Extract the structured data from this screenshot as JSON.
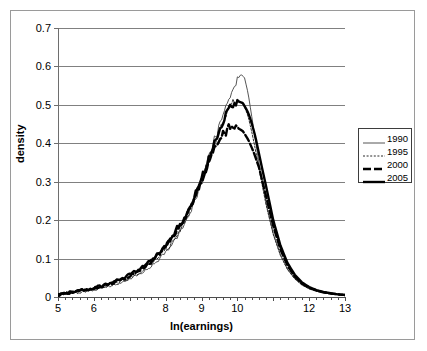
{
  "chart_data": {
    "type": "line",
    "title": "",
    "xlabel": "ln(earnings)",
    "ylabel": "density",
    "xlim": [
      5,
      13
    ],
    "ylim": [
      0,
      0.7
    ],
    "grid": true,
    "legend_position": "right",
    "y_ticks": [
      "0",
      "0.1",
      "0.2",
      "0.3",
      "0.4",
      "0.5",
      "0.6",
      "0.7"
    ],
    "y_tick_values": [
      0,
      0.1,
      0.2,
      0.3,
      0.4,
      0.5,
      0.6,
      0.7
    ],
    "x_ticks": [
      "5",
      "6",
      "",
      "8",
      "9",
      "10",
      "",
      "12",
      "13"
    ],
    "x_tick_values": [
      5,
      6,
      7,
      8,
      9,
      10,
      11,
      12,
      13
    ],
    "x_minor_tick_step": 0.2,
    "series": [
      {
        "name": "1990",
        "style": "thin-solid",
        "color": "#555555",
        "width": 1,
        "x": [
          5.0,
          5.2,
          5.4,
          5.6,
          5.8,
          6.0,
          6.2,
          6.4,
          6.6,
          6.8,
          7.0,
          7.2,
          7.4,
          7.6,
          7.8,
          8.0,
          8.2,
          8.4,
          8.6,
          8.8,
          9.0,
          9.2,
          9.4,
          9.6,
          9.8,
          10.0,
          10.1,
          10.2,
          10.3,
          10.4,
          10.5,
          10.6,
          10.8,
          11.0,
          11.2,
          11.4,
          11.6,
          11.8,
          12.0,
          12.2,
          12.4,
          12.6,
          12.8,
          13.0
        ],
        "y": [
          0.006,
          0.009,
          0.012,
          0.014,
          0.017,
          0.02,
          0.024,
          0.028,
          0.033,
          0.039,
          0.046,
          0.055,
          0.066,
          0.08,
          0.096,
          0.116,
          0.14,
          0.17,
          0.205,
          0.248,
          0.3,
          0.36,
          0.42,
          0.48,
          0.53,
          0.565,
          0.58,
          0.57,
          0.53,
          0.47,
          0.41,
          0.35,
          0.245,
          0.165,
          0.11,
          0.072,
          0.048,
          0.032,
          0.022,
          0.016,
          0.012,
          0.009,
          0.007,
          0.005
        ]
      },
      {
        "name": "1995",
        "style": "dotted",
        "color": "#2b2b2b",
        "width": 1,
        "x": [
          5.0,
          5.2,
          5.4,
          5.6,
          5.8,
          6.0,
          6.2,
          6.4,
          6.6,
          6.8,
          7.0,
          7.2,
          7.4,
          7.6,
          7.8,
          8.0,
          8.2,
          8.4,
          8.6,
          8.8,
          9.0,
          9.2,
          9.4,
          9.6,
          9.8,
          10.0,
          10.1,
          10.2,
          10.3,
          10.4,
          10.5,
          10.6,
          10.8,
          11.0,
          11.2,
          11.4,
          11.6,
          11.8,
          12.0,
          12.2,
          12.4,
          12.6,
          12.8,
          13.0
        ],
        "y": [
          0.005,
          0.008,
          0.011,
          0.013,
          0.016,
          0.02,
          0.024,
          0.029,
          0.035,
          0.042,
          0.05,
          0.06,
          0.072,
          0.086,
          0.102,
          0.122,
          0.146,
          0.175,
          0.21,
          0.252,
          0.3,
          0.355,
          0.41,
          0.462,
          0.498,
          0.512,
          0.508,
          0.495,
          0.47,
          0.43,
          0.385,
          0.335,
          0.24,
          0.163,
          0.108,
          0.071,
          0.047,
          0.031,
          0.021,
          0.015,
          0.011,
          0.008,
          0.006,
          0.005
        ]
      },
      {
        "name": "2000",
        "style": "thick-dashed",
        "color": "#000000",
        "width": 2.4,
        "x": [
          5.0,
          5.2,
          5.4,
          5.6,
          5.8,
          6.0,
          6.2,
          6.4,
          6.6,
          6.8,
          7.0,
          7.2,
          7.4,
          7.6,
          7.8,
          8.0,
          8.2,
          8.4,
          8.6,
          8.8,
          9.0,
          9.2,
          9.4,
          9.6,
          9.8,
          10.0,
          10.15,
          10.3,
          10.45,
          10.6,
          10.8,
          11.0,
          11.2,
          11.4,
          11.6,
          11.8,
          12.0,
          12.2,
          12.4,
          12.6,
          12.8,
          13.0
        ],
        "y": [
          0.006,
          0.01,
          0.013,
          0.016,
          0.019,
          0.023,
          0.028,
          0.034,
          0.04,
          0.047,
          0.056,
          0.066,
          0.078,
          0.092,
          0.11,
          0.13,
          0.155,
          0.184,
          0.218,
          0.258,
          0.302,
          0.348,
          0.392,
          0.424,
          0.438,
          0.44,
          0.432,
          0.41,
          0.378,
          0.338,
          0.262,
          0.185,
          0.124,
          0.081,
          0.053,
          0.035,
          0.024,
          0.017,
          0.012,
          0.009,
          0.007,
          0.005
        ]
      },
      {
        "name": "2005",
        "style": "thick-solid",
        "color": "#000000",
        "width": 2.4,
        "x": [
          5.0,
          5.2,
          5.4,
          5.6,
          5.8,
          6.0,
          6.2,
          6.4,
          6.6,
          6.8,
          7.0,
          7.2,
          7.4,
          7.6,
          7.8,
          8.0,
          8.2,
          8.4,
          8.6,
          8.8,
          9.0,
          9.2,
          9.4,
          9.6,
          9.8,
          10.0,
          10.15,
          10.3,
          10.4,
          10.5,
          10.65,
          10.8,
          11.0,
          11.2,
          11.4,
          11.6,
          11.8,
          12.0,
          12.2,
          12.4,
          12.6,
          12.8,
          13.0
        ],
        "y": [
          0.007,
          0.011,
          0.014,
          0.017,
          0.02,
          0.024,
          0.029,
          0.034,
          0.04,
          0.048,
          0.057,
          0.068,
          0.08,
          0.095,
          0.113,
          0.134,
          0.159,
          0.188,
          0.222,
          0.262,
          0.308,
          0.36,
          0.412,
          0.462,
          0.498,
          0.51,
          0.505,
          0.48,
          0.452,
          0.418,
          0.352,
          0.288,
          0.2,
          0.134,
          0.088,
          0.058,
          0.038,
          0.026,
          0.018,
          0.013,
          0.01,
          0.007,
          0.005
        ]
      }
    ],
    "noise_seed": 7,
    "noise_region": [
      5.0,
      10.0
    ],
    "noise_amplitude": 0.016
  },
  "legend": {
    "items": [
      {
        "label": "1990",
        "style": "thin-solid"
      },
      {
        "label": "1995",
        "style": "dotted"
      },
      {
        "label": "2000",
        "style": "thick-dashed"
      },
      {
        "label": "2005",
        "style": "thick-solid"
      }
    ]
  }
}
